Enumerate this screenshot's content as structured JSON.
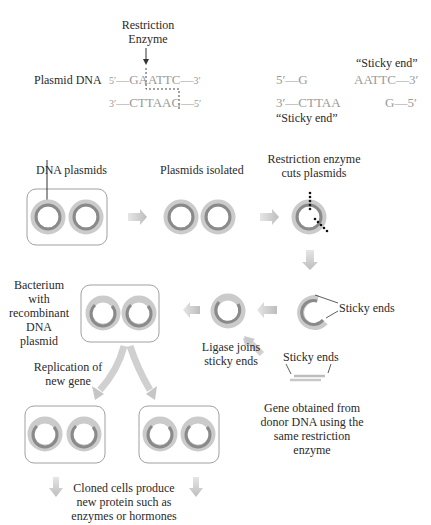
{
  "top": {
    "enzyme_label_1": "Restriction",
    "enzyme_label_2": "Enzyme",
    "plasmid_dna_label": "Plasmid DNA",
    "strand_top": {
      "prime5": "5′",
      "dash": "—",
      "seq": "GAATTC",
      "dash2": "—",
      "prime3": "3′"
    },
    "strand_bottom": {
      "prime3": "3′",
      "dash": "—",
      "seq": "CTTAAG",
      "dash2": "—",
      "prime5": "5′"
    },
    "cut_left_top": "5′—G",
    "cut_left_bottom": "3′—CTTAA",
    "cut_right_top": "AATTC—3′",
    "cut_right_bottom": "G—5′",
    "sticky_end_top": "“Sticky end”",
    "sticky_end_bottom": "“Sticky end”"
  },
  "steps": {
    "dna_plasmids": "DNA plasmids",
    "plasmids_isolated": "Plasmids isolated",
    "restriction_cuts_1": "Restriction enzyme",
    "restriction_cuts_2": "cuts plasmids",
    "sticky_ends_right": "Sticky ends",
    "ligase_1": "Ligase joins",
    "ligase_2": "sticky ends",
    "bacterium_1": "Bacterium",
    "bacterium_2": "with",
    "bacterium_3": "recombinant",
    "bacterium_4": "DNA",
    "bacterium_5": "plasmid",
    "replication_1": "Replication of",
    "replication_2": "new gene",
    "gene_sticky_ends": "Sticky ends",
    "gene_obtained_1": "Gene obtained from",
    "gene_obtained_2": "donor DNA using the",
    "gene_obtained_3": "same restriction",
    "gene_obtained_4": "enzyme",
    "cloned_1": "Cloned cells produce",
    "cloned_2": "new protein such as",
    "cloned_3": "enzymes or hormones"
  },
  "colors": {
    "ring_outer": "#c8c8c8",
    "ring_inner": "#8e8e8e",
    "arrow": "#c9c9c9",
    "text": "#2a2a2a",
    "sequence": "#9a9a9a"
  }
}
